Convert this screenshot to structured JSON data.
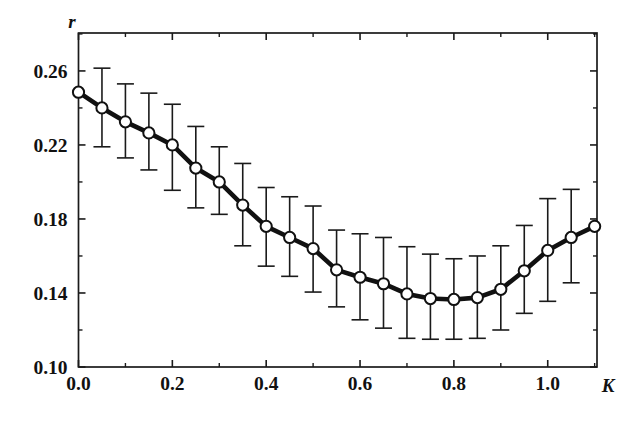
{
  "chart_data": {
    "type": "line",
    "title": "",
    "subtitle": "",
    "xlabel": "K",
    "ylabel": "r",
    "xlim": [
      0.0,
      1.105
    ],
    "ylim": [
      0.1,
      0.2805
    ],
    "grid": false,
    "legend": null,
    "xticks": [
      0.0,
      0.2,
      0.4,
      0.6,
      0.8,
      1.0
    ],
    "xtick_labels": [
      "0.0",
      "0.2",
      "0.4",
      "0.6",
      "0.8",
      "1.0"
    ],
    "xminor_ticks": [
      0.1,
      0.3,
      0.5,
      0.7,
      0.9,
      1.1
    ],
    "yticks": [
      0.1,
      0.14,
      0.18,
      0.22,
      0.26
    ],
    "ytick_labels": [
      "0.10",
      "0.14",
      "0.18",
      "0.22",
      "0.26"
    ],
    "yminor_ticks": [
      0.12,
      0.16,
      0.2,
      0.24,
      0.28
    ],
    "marker": "open-circle",
    "error_bars": "symmetric-vertical-with-caps",
    "x": [
      0.0,
      0.05,
      0.1,
      0.15,
      0.2,
      0.25,
      0.3,
      0.35,
      0.4,
      0.45,
      0.5,
      0.55,
      0.6,
      0.65,
      0.7,
      0.75,
      0.8,
      0.85,
      0.9,
      0.95,
      1.0,
      1.05,
      1.1
    ],
    "values": [
      0.2485,
      0.24,
      0.2325,
      0.2265,
      0.22,
      0.2075,
      0.2,
      0.1875,
      0.176,
      0.17,
      0.164,
      0.1525,
      0.1485,
      0.145,
      0.1395,
      0.137,
      0.1365,
      0.1375,
      0.142,
      0.152,
      0.163,
      0.17,
      0.176
    ],
    "err_low": [
      0.2485,
      0.219,
      0.213,
      0.2065,
      0.1955,
      0.186,
      0.1825,
      0.1655,
      0.1545,
      0.149,
      0.1405,
      0.1325,
      0.1255,
      0.121,
      0.1155,
      0.115,
      0.115,
      0.1155,
      0.12,
      0.129,
      0.1355,
      0.1455,
      0.176
    ],
    "err_high": [
      0.2485,
      0.2615,
      0.253,
      0.248,
      0.242,
      0.23,
      0.219,
      0.21,
      0.197,
      0.192,
      0.187,
      0.174,
      0.172,
      0.17,
      0.165,
      0.161,
      0.1585,
      0.16,
      0.1655,
      0.1765,
      0.191,
      0.196,
      0.176
    ]
  },
  "axes": {
    "ylabel_text": "r",
    "xlabel_text": "K"
  }
}
